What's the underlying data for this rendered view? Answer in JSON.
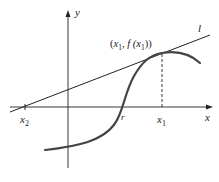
{
  "diagram": {
    "type": "newton-method-tangent",
    "axes": {
      "x_label": "x",
      "y_label": "y"
    },
    "tangent_line_label": "l",
    "point_label": {
      "open": "(",
      "x": "x",
      "x_sub": "1",
      "comma_f": ", f (",
      "x2": "x",
      "x2_sub": "1",
      "close": "))"
    },
    "x_ticks": [
      {
        "name": "x2",
        "base": "x",
        "sub": "2"
      },
      {
        "name": "r",
        "base": "r",
        "sub": ""
      },
      {
        "name": "x1",
        "base": "x",
        "sub": "1"
      }
    ],
    "colors": {
      "axis": "#222222",
      "curve": "#444444",
      "tangent": "#222222"
    }
  }
}
